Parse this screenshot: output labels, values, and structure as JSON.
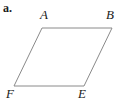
{
  "figure": {
    "part_label": "a.",
    "shape_name": "parallelogram",
    "background_color": "#ffffff",
    "stroke_color": "#8a8a8a",
    "stroke_width": 1,
    "text_color": "#1a1a1a",
    "vertices": [
      {
        "name": "A",
        "label": "A",
        "x": 42,
        "y": 28
      },
      {
        "name": "B",
        "label": "B",
        "x": 112,
        "y": 28
      },
      {
        "name": "E",
        "label": "E",
        "x": 84,
        "y": 86
      },
      {
        "name": "F",
        "label": "F",
        "x": 14,
        "y": 86
      }
    ],
    "edges": [
      {
        "name": "edge-AB",
        "from": "A",
        "to": "B"
      },
      {
        "name": "edge-BE",
        "from": "B",
        "to": "E"
      },
      {
        "name": "edge-EF",
        "from": "E",
        "to": "F"
      },
      {
        "name": "edge-FA",
        "from": "F",
        "to": "A"
      }
    ],
    "polygon_points": "42,28 112,28 84,86 14,86"
  }
}
